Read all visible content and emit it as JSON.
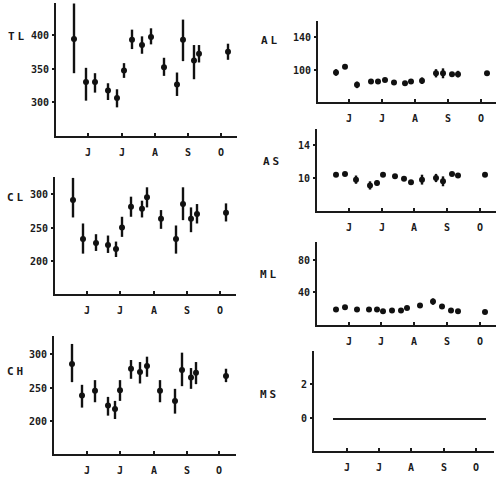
{
  "chart_data": [
    {
      "id": "TL",
      "type": "scatter",
      "error_bars": true,
      "label": "TL",
      "yticks": [
        300,
        350,
        400
      ],
      "ylim": [
        250,
        450
      ],
      "xtick_labels": [
        "J",
        "J",
        "A",
        "S",
        "O"
      ],
      "x": [
        74,
        86,
        95,
        108,
        117,
        124,
        132,
        142,
        151,
        164,
        177,
        183,
        194,
        199,
        228
      ],
      "values": [
        394,
        330,
        330,
        317,
        306,
        347,
        393,
        385,
        397,
        352,
        326,
        393,
        362,
        372,
        375
      ],
      "err_low": [
        343,
        302,
        314,
        303,
        292,
        336,
        379,
        372,
        386,
        339,
        309,
        361,
        334,
        359,
        363
      ],
      "err_high": [
        447,
        351,
        343,
        328,
        319,
        358,
        408,
        398,
        410,
        366,
        344,
        423,
        385,
        385,
        387
      ],
      "frame": {
        "left": 55,
        "bottom": 137,
        "right": 237,
        "top": 3,
        "y_px": {
          "400": 35,
          "350": 69,
          "300": 102
        },
        "month_px": [
          88,
          122,
          155,
          188,
          221
        ],
        "label_x": 8,
        "label_y": 40
      }
    },
    {
      "id": "CL",
      "type": "scatter",
      "error_bars": true,
      "label": "CL",
      "yticks": [
        200,
        250,
        300
      ],
      "ylim": [
        150,
        330
      ],
      "xtick_labels": [
        "J",
        "J",
        "A",
        "S",
        "O"
      ],
      "x": [
        73,
        83,
        96,
        108,
        116,
        122,
        131,
        142,
        147,
        161,
        176,
        183,
        191,
        197,
        226
      ],
      "values": [
        291,
        233,
        227,
        224,
        218,
        250,
        281,
        278,
        295,
        263,
        233,
        285,
        263,
        270,
        272
      ],
      "err_low": [
        265,
        211,
        215,
        212,
        206,
        236,
        266,
        265,
        280,
        248,
        211,
        261,
        243,
        256,
        259
      ],
      "err_high": [
        324,
        256,
        240,
        238,
        229,
        266,
        296,
        290,
        310,
        276,
        253,
        310,
        280,
        285,
        286
      ],
      "frame": {
        "left": 54,
        "bottom": 295,
        "right": 236,
        "top": 177,
        "y_px": {
          "300": 194,
          "250": 228,
          "200": 261
        },
        "month_px": [
          87,
          120,
          154,
          187,
          220
        ],
        "label_x": 7,
        "label_y": 201
      }
    },
    {
      "id": "CH",
      "type": "scatter",
      "error_bars": true,
      "label": "CH",
      "yticks": [
        200,
        250,
        300
      ],
      "ylim": [
        150,
        340
      ],
      "xtick_labels": [
        "J",
        "J",
        "A",
        "S",
        "O"
      ],
      "x": [
        72,
        82,
        95,
        108,
        115,
        120,
        131,
        140,
        147,
        160,
        175,
        182,
        191,
        196,
        226
      ],
      "values": [
        285,
        238,
        245,
        223,
        218,
        246,
        278,
        273,
        282,
        245,
        230,
        276,
        265,
        272,
        267
      ],
      "err_low": [
        258,
        220,
        228,
        208,
        203,
        230,
        263,
        256,
        266,
        228,
        211,
        252,
        248,
        255,
        258
      ],
      "err_high": [
        315,
        254,
        261,
        236,
        230,
        261,
        291,
        288,
        296,
        261,
        248,
        302,
        279,
        288,
        278
      ],
      "frame": {
        "left": 53,
        "bottom": 455,
        "right": 236,
        "top": 336,
        "y_px": {
          "300": 354,
          "250": 388,
          "200": 421
        },
        "month_px": [
          87,
          120,
          154,
          187,
          219
        ],
        "label_x": 7,
        "label_y": 375
      }
    },
    {
      "id": "AL",
      "type": "scatter",
      "error_bars": true,
      "label": "AL",
      "yticks": [
        100,
        140
      ],
      "ylim": [
        60,
        160
      ],
      "xtick_labels": [
        "J",
        "J",
        "A",
        "S",
        "O"
      ],
      "x": [
        336,
        345,
        357,
        371,
        378,
        385,
        394,
        405,
        411,
        422,
        436,
        443,
        452,
        458,
        487
      ],
      "values": [
        97,
        104,
        82,
        86,
        86,
        88,
        85,
        84,
        86,
        87,
        96,
        96,
        95,
        95,
        96
      ],
      "err_low": [
        93,
        102,
        78,
        85,
        85,
        86,
        84,
        83,
        85,
        83,
        91,
        90,
        94,
        91,
        95
      ],
      "err_high": [
        101,
        106,
        86,
        87,
        87,
        90,
        86,
        85,
        87,
        91,
        101,
        102,
        96,
        99,
        97
      ],
      "frame": {
        "left": 317,
        "bottom": 103,
        "right": 496,
        "top": 21,
        "y_px": {
          "140": 37,
          "100": 70
        },
        "month_px": [
          349,
          382,
          415,
          448,
          481
        ],
        "label_x": 261,
        "label_y": 44
      }
    },
    {
      "id": "AS",
      "type": "scatter",
      "error_bars": true,
      "label": "AS",
      "yticks": [
        10,
        14
      ],
      "ylim": [
        6,
        16
      ],
      "xtick_labels": [
        "J",
        "J",
        "A",
        "S",
        "O"
      ],
      "x": [
        336,
        345,
        356,
        370,
        377,
        383,
        395,
        404,
        411,
        422,
        436,
        443,
        452,
        458,
        485
      ],
      "values": [
        10.4,
        10.5,
        9.8,
        9.1,
        9.4,
        10.4,
        10.2,
        9.9,
        9.5,
        9.8,
        10.0,
        9.6,
        10.5,
        10.3,
        10.4
      ],
      "err_low": [
        10.2,
        10.3,
        9.3,
        8.6,
        9.1,
        10.3,
        10.1,
        9.8,
        9.4,
        9.2,
        9.5,
        9.0,
        10.4,
        10.2,
        10.3
      ],
      "err_high": [
        10.6,
        10.7,
        10.3,
        9.6,
        9.7,
        10.5,
        10.3,
        10.0,
        9.6,
        10.4,
        10.5,
        10.2,
        10.6,
        10.4,
        10.5
      ],
      "frame": {
        "left": 316,
        "bottom": 212,
        "right": 496,
        "top": 129,
        "y_px": {
          "14": 145,
          "10": 178
        },
        "month_px": [
          349,
          382,
          414,
          447,
          480
        ],
        "label_x": 263,
        "label_y": 165
      }
    },
    {
      "id": "ML",
      "type": "scatter",
      "error_bars": true,
      "label": "ML",
      "yticks": [
        40,
        80
      ],
      "ylim": [
        0,
        100
      ],
      "xtick_labels": [
        "J",
        "J",
        "A",
        "S",
        "O"
      ],
      "x": [
        336,
        345,
        357,
        369,
        377,
        383,
        392,
        401,
        407,
        420,
        433,
        442,
        451,
        458,
        485
      ],
      "values": [
        18,
        21,
        18,
        18,
        18,
        16,
        17,
        17,
        20,
        23,
        28,
        22,
        17,
        16,
        15
      ],
      "err_low": [
        17,
        20,
        17,
        17,
        17,
        15,
        16,
        16,
        19,
        21,
        24,
        21,
        16,
        15,
        14
      ],
      "err_high": [
        19,
        22,
        19,
        19,
        19,
        17,
        18,
        18,
        21,
        25,
        32,
        23,
        18,
        17,
        16
      ],
      "frame": {
        "left": 316,
        "bottom": 326,
        "right": 496,
        "top": 242,
        "y_px": {
          "80": 260,
          "40": 292
        },
        "month_px": [
          349,
          381,
          414,
          447,
          480
        ],
        "label_x": 260,
        "label_y": 278
      }
    },
    {
      "id": "MS",
      "type": "line",
      "label": "MS",
      "yticks": [
        0,
        2
      ],
      "ylim": [
        -2,
        4
      ],
      "xtick_labels": [
        "J",
        "J",
        "A",
        "S",
        "O"
      ],
      "x": [
        333,
        486
      ],
      "values": [
        0,
        0
      ],
      "frame": {
        "left": 313,
        "bottom": 452,
        "right": 494,
        "top": 351,
        "y_px": {
          "2": 384,
          "0": 418
        },
        "month_px": [
          347,
          379,
          411,
          444,
          476
        ],
        "label_x": 260,
        "label_y": 398
      }
    }
  ]
}
